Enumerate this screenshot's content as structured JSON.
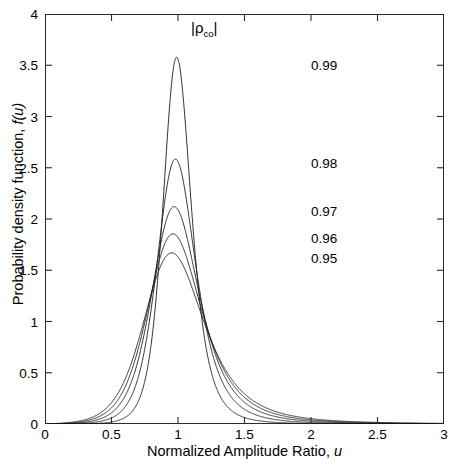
{
  "chart_data": {
    "type": "line",
    "title": "",
    "xlabel": "Normalized Amplitude Ratio, u",
    "ylabel": "Probability density function, f(u)",
    "xlim": [
      0,
      3
    ],
    "ylim": [
      0,
      4
    ],
    "xticks": [
      "0",
      "0.5",
      "1",
      "1.5",
      "2",
      "2.5",
      "3"
    ],
    "xtick_values": [
      0,
      0.5,
      1,
      1.5,
      2,
      2.5,
      3
    ],
    "yticks": [
      "0",
      "0.5",
      "1",
      "1.5",
      "2",
      "2.5",
      "3",
      "3.5",
      "4"
    ],
    "ytick_values": [
      0,
      0.5,
      1,
      1.5,
      2,
      2.5,
      3,
      3.5,
      4
    ],
    "grid": false,
    "legend_position": "inside-upper-right",
    "legend_title": "|ρco|",
    "legend_title_parts": {
      "rho": "ρ",
      "sub": "co"
    },
    "line_color": "#1a1a1a",
    "axis_color": "#2b2b2b",
    "background": "#ffffff",
    "series": [
      {
        "name": "0.99",
        "rho": 0.99,
        "peak_x": 1.0,
        "peak_y": 3.56,
        "label_x": 2.0,
        "label_y": 3.5
      },
      {
        "name": "0.98",
        "rho": 0.98,
        "peak_x": 1.0,
        "peak_y": 2.56,
        "label_x": 2.0,
        "label_y": 2.55
      },
      {
        "name": "0.97",
        "rho": 0.97,
        "peak_x": 1.0,
        "peak_y": 2.09,
        "label_x": 2.0,
        "label_y": 2.08
      },
      {
        "name": "0.96",
        "rho": 0.96,
        "peak_x": 1.0,
        "peak_y": 1.82,
        "label_x": 2.0,
        "label_y": 1.81
      },
      {
        "name": "0.95",
        "rho": 0.95,
        "peak_x": 1.0,
        "peak_y": 1.63,
        "label_x": 2.0,
        "label_y": 1.62
      }
    ]
  }
}
